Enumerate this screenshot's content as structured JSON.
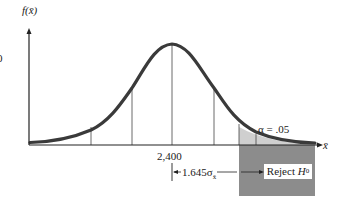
{
  "diagram": {
    "type": "normal-distribution-hypothesis-test",
    "y_axis_label": "f(x̄)",
    "x_axis_label": "x̄",
    "left_edge_label": "0",
    "mean_label": "2,400",
    "alpha_label": "α = .05",
    "distance_label": "1.645σ",
    "distance_subscript": "x̄",
    "reject_label": "Reject",
    "reject_hypothesis": "H",
    "reject_subscript": "0",
    "colors": {
      "curve": "#3a3a3a",
      "axis": "#222222",
      "tail_fill": "#cfcfcf",
      "reject_region": "#8c8c8c",
      "background": "#ffffff"
    }
  }
}
